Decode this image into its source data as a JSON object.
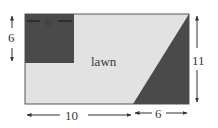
{
  "diagram": {
    "region_label": "lawn",
    "dimensions": {
      "square_width": "6",
      "square_height": "6",
      "total_height": "11",
      "bottom_left_length": "10",
      "bottom_right_length": "6"
    },
    "colors": {
      "lawn": "#e2e2e2",
      "shaded": "#4a4a4a",
      "border": "#555555",
      "arrow": "#333333"
    }
  }
}
